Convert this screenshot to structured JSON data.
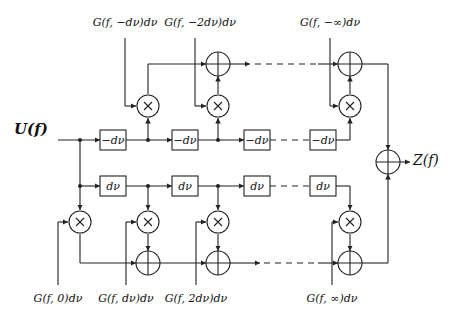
{
  "diagram": {
    "input_label": "U(f)",
    "output_label": "Z(f)",
    "top_gain_labels": [
      "G(f, −dν)dν",
      "G(f, −2dν)dν",
      "G(f, −∞)dν"
    ],
    "bottom_gain_labels": [
      "G(f, 0)dν",
      "G(f, dν)dν",
      "G(f, 2dν)dν",
      "G(f, ∞)dν"
    ],
    "top_delay_labels": [
      "−dν",
      "−dν",
      "−dν",
      "−dν"
    ],
    "bottom_delay_labels": [
      "dν",
      "dν",
      "dν",
      "dν"
    ],
    "multiplier_symbol": "×",
    "adder_symbol": "+",
    "colors": {
      "stroke": "#222222",
      "background": "#ffffff"
    }
  }
}
